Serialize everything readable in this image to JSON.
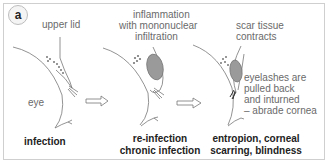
{
  "figure": {
    "panel_label": "a",
    "stages": [
      {
        "id": "infection",
        "annotations": [
          "upper lid",
          "eye"
        ],
        "caption": [
          "infection"
        ]
      },
      {
        "id": "re-infection",
        "annotations": [
          "inflammation",
          "with mononuclear",
          "infiltration"
        ],
        "caption": [
          "re-infection",
          "chronic infection"
        ]
      },
      {
        "id": "entropion",
        "annotations": [
          "scar tissue",
          "contracts",
          "eyelashes are",
          "pulled back",
          "and inturned",
          "– abrade cornea"
        ],
        "caption": [
          "entropion, corneal",
          "scarring, blindness"
        ]
      }
    ],
    "arrows": [
      "stage1-to-stage2",
      "stage2-to-stage3"
    ],
    "colors": {
      "line": "#777777",
      "inflammation_fill": "#9a9a9a",
      "border": "#cfcfcf"
    }
  }
}
